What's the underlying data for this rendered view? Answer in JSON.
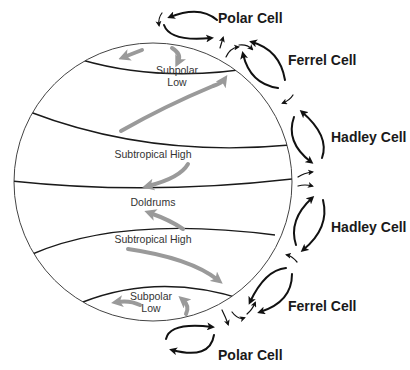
{
  "colors": {
    "wind_arrow": "#9a9a9a",
    "cell_arrow": "#111111",
    "outline": "#444444",
    "label": "#333333"
  },
  "globe_labels": {
    "subpolar_low_north_line1": "Subpolar",
    "subpolar_low_north_line2": "Low",
    "subtropical_high_north": "Subtropical High",
    "doldrums": "Doldrums",
    "subtropical_high_south": "Subtropical High",
    "subpolar_low_south_line1": "Subpolar",
    "subpolar_low_south_line2": "Low"
  },
  "cells": [
    {
      "id": "polar-north",
      "label": "Polar Cell"
    },
    {
      "id": "ferrel-north",
      "label": "Ferrel Cell"
    },
    {
      "id": "hadley-north",
      "label": "Hadley Cell"
    },
    {
      "id": "hadley-south",
      "label": "Hadley Cell"
    },
    {
      "id": "ferrel-south",
      "label": "Ferrel Cell"
    },
    {
      "id": "polar-south",
      "label": "Polar Cell"
    }
  ]
}
